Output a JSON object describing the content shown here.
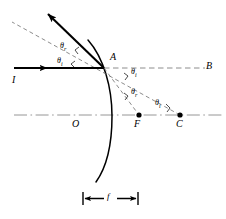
{
  "figure": {
    "type": "optics-ray-diagram",
    "background_color": "#ffffff",
    "stroke_color": "#000000",
    "axis_color": "#808080"
  },
  "points": {
    "vertex_label": "A",
    "axis_origin_label": "O",
    "focus_label": "F",
    "center_label": "C",
    "axis_end_label": "B"
  },
  "rays": {
    "incident_label": "I"
  },
  "angles": {
    "reflected_upper": "θ",
    "reflected_upper_sub": "r",
    "incident_upper": "θ",
    "incident_upper_sub": "i",
    "incident_at_a": "θ",
    "incident_at_a_sub": "i",
    "reflected_mid": "θ",
    "reflected_mid_sub": "r",
    "incident_at_c": "θ",
    "incident_at_c_sub": "i"
  },
  "measurements": {
    "focal_length_label": "f"
  }
}
